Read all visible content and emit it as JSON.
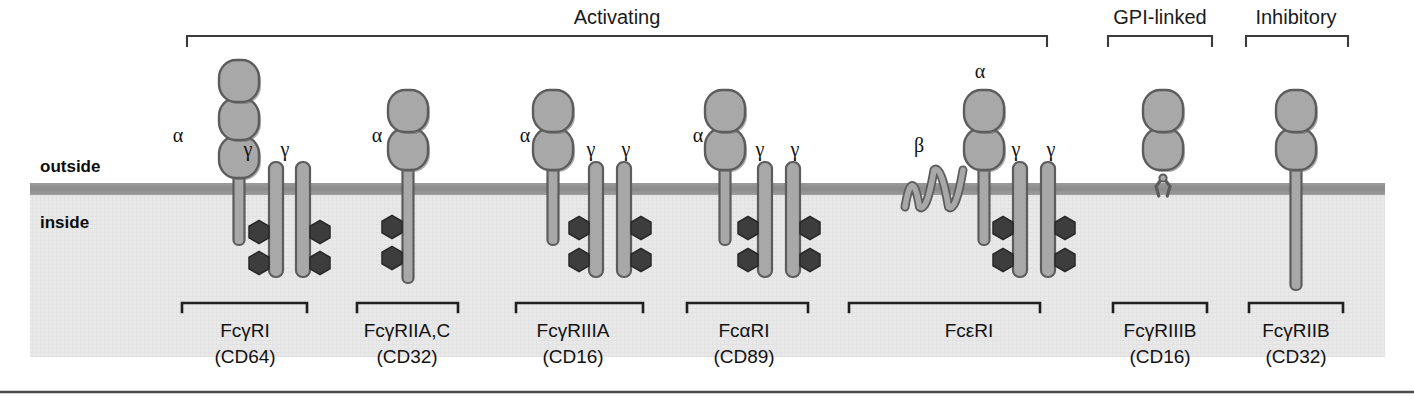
{
  "figure": {
    "title_groups": [
      {
        "name": "activating",
        "label": "Activating",
        "x": 617,
        "bracket": {
          "x1": 187,
          "x2": 1047,
          "y": 36,
          "tick": 10
        }
      },
      {
        "name": "gpi-linked",
        "label": "GPI-linked",
        "x": 1160,
        "bracket": {
          "x1": 1108,
          "x2": 1212,
          "y": 36,
          "tick": 10
        }
      },
      {
        "name": "inhibitory",
        "label": "Inhibitory",
        "x": 1296,
        "bracket": {
          "x1": 1246,
          "x2": 1348,
          "y": 36,
          "tick": 10
        }
      }
    ],
    "membrane": {
      "outside_label": "outside",
      "inside_label": "inside",
      "outside_label_x": 40,
      "outside_label_y": 172,
      "inside_label_x": 40,
      "inside_label_y": 228,
      "y": 183,
      "thickness": 12,
      "x_start": 30,
      "x_end": 1385,
      "color": "#8f8f8f",
      "cytoplasm_color": "#e8e8e8",
      "cytoplasm_bottom": 357
    },
    "colors": {
      "chain_fill": "#a8a8a8",
      "chain_stroke": "#5c5c5c",
      "itam_fill": "#3d3d3d",
      "itam_stroke": "#2a2a2a",
      "membrane": "#8f8f8f",
      "cytoplasm": "#e8e8e8",
      "text": "#121212",
      "bracket": "#3a3a3a"
    },
    "receptors": [
      {
        "name": "fc-gamma-ri",
        "label_line1": "FcγRI",
        "label_line2": "(CD64)",
        "label_x": 245,
        "bracket": {
          "x1": 182,
          "x2": 307,
          "y": 303,
          "tick": 9
        },
        "alpha": {
          "label": "α",
          "label_x": 178,
          "label_y": 142,
          "x": 239,
          "domains": 3,
          "domain_top": 60,
          "stalk_bottom": 243,
          "has_itam": false,
          "itam_left": [],
          "itam_right": []
        },
        "gammas": [
          {
            "label": "γ",
            "label_x": 248,
            "label_y": 156,
            "x": 276,
            "top": 162,
            "bottom": 277,
            "itam_side": "left",
            "itam_y": [
              232,
              263
            ]
          },
          {
            "label": "γ",
            "label_x": 285,
            "label_y": 156,
            "x": 303,
            "top": 162,
            "bottom": 277,
            "itam_side": "right",
            "itam_y": [
              232,
              263
            ]
          }
        ],
        "beta": null,
        "gpi": false
      },
      {
        "name": "fc-gamma-riia-c",
        "label_line1": "FcγRIIA,C",
        "label_line2": "(CD32)",
        "label_x": 407,
        "bracket": {
          "x1": 357,
          "x2": 458,
          "y": 303,
          "tick": 9
        },
        "alpha": {
          "label": "α",
          "label_x": 377,
          "label_y": 142,
          "x": 408,
          "domains": 2,
          "domain_top": 90,
          "stalk_bottom": 281,
          "has_itam": true,
          "itam_left": [
            227,
            258
          ],
          "itam_right": []
        },
        "gammas": [],
        "beta": null,
        "gpi": false
      },
      {
        "name": "fc-gamma-riiia",
        "label_line1": "FcγRIIIA",
        "label_line2": "(CD16)",
        "label_x": 573,
        "bracket": {
          "x1": 516,
          "x2": 643,
          "y": 303,
          "tick": 9
        },
        "alpha": {
          "label": "α",
          "label_x": 525,
          "label_y": 142,
          "x": 553,
          "domains": 2,
          "domain_top": 90,
          "stalk_bottom": 243,
          "has_itam": false,
          "itam_left": [],
          "itam_right": []
        },
        "gammas": [
          {
            "label": "γ",
            "label_x": 591,
            "label_y": 156,
            "x": 596,
            "top": 162,
            "bottom": 277,
            "itam_side": "left",
            "itam_y": [
              228,
              260
            ]
          },
          {
            "label": "γ",
            "label_x": 626,
            "label_y": 156,
            "x": 624,
            "top": 162,
            "bottom": 277,
            "itam_side": "right",
            "itam_y": [
              228,
              260
            ]
          }
        ],
        "beta": null,
        "gpi": false
      },
      {
        "name": "fc-alpha-ri",
        "label_line1": "FcαRI",
        "label_line2": "(CD89)",
        "label_x": 744,
        "bracket": {
          "x1": 687,
          "x2": 808,
          "y": 303,
          "tick": 9
        },
        "alpha": {
          "label": "α",
          "label_x": 698,
          "label_y": 142,
          "x": 725,
          "domains": 2,
          "domain_top": 90,
          "stalk_bottom": 243,
          "has_itam": false,
          "itam_left": [],
          "itam_right": []
        },
        "gammas": [
          {
            "label": "γ",
            "label_x": 760,
            "label_y": 156,
            "x": 765,
            "top": 162,
            "bottom": 277,
            "itam_side": "left",
            "itam_y": [
              228,
              260
            ]
          },
          {
            "label": "γ",
            "label_x": 795,
            "label_y": 156,
            "x": 793,
            "top": 162,
            "bottom": 277,
            "itam_side": "right",
            "itam_y": [
              228,
              260
            ]
          }
        ],
        "beta": null,
        "gpi": false
      },
      {
        "name": "fc-epsilon-ri",
        "label_line1": "FcεRI",
        "label_line2": "",
        "label_x": 969,
        "bracket": {
          "x1": 849,
          "x2": 1040,
          "y": 303,
          "tick": 9
        },
        "alpha": {
          "label": "α",
          "label_x": 980,
          "label_y": 78,
          "x": 984,
          "domains": 2,
          "domain_top": 90,
          "stalk_bottom": 243,
          "has_itam": false,
          "itam_left": [],
          "itam_right": []
        },
        "gammas": [
          {
            "label": "γ",
            "label_x": 1016,
            "label_y": 156,
            "x": 1020,
            "top": 162,
            "bottom": 277,
            "itam_side": "left",
            "itam_y": [
              228,
              260
            ]
          },
          {
            "label": "γ",
            "label_x": 1051,
            "label_y": 156,
            "x": 1048,
            "top": 162,
            "bottom": 277,
            "itam_side": "right",
            "itam_y": [
              228,
              260
            ]
          }
        ],
        "beta": {
          "label": "β",
          "label_x": 919,
          "label_y": 152,
          "x_start": 905,
          "x_end": 963
        },
        "gpi": false
      },
      {
        "name": "fc-gamma-riiib",
        "label_line1": "FcγRIIIB",
        "label_line2": "(CD16)",
        "label_x": 1160,
        "bracket": {
          "x1": 1113,
          "x2": 1207,
          "y": 303,
          "tick": 9
        },
        "alpha": {
          "label": "",
          "label_x": 0,
          "label_y": 0,
          "x": 1163,
          "domains": 2,
          "domain_top": 90,
          "stalk_bottom": 0,
          "has_itam": false,
          "itam_left": [],
          "itam_right": []
        },
        "gammas": [],
        "beta": null,
        "gpi": true
      },
      {
        "name": "fc-gamma-riib",
        "label_line1": "FcγRIIB",
        "label_line2": "(CD32)",
        "label_x": 1296,
        "bracket": {
          "x1": 1249,
          "x2": 1343,
          "y": 303,
          "tick": 9
        },
        "alpha": {
          "label": "",
          "label_x": 0,
          "label_y": 0,
          "x": 1296,
          "domains": 2,
          "domain_top": 90,
          "stalk_bottom": 288,
          "has_itam": false,
          "itam_left": [],
          "itam_right": []
        },
        "gammas": [],
        "beta": null,
        "gpi": false
      }
    ],
    "bottom_rule": {
      "x1": 0,
      "x2": 1414,
      "y": 392
    }
  }
}
